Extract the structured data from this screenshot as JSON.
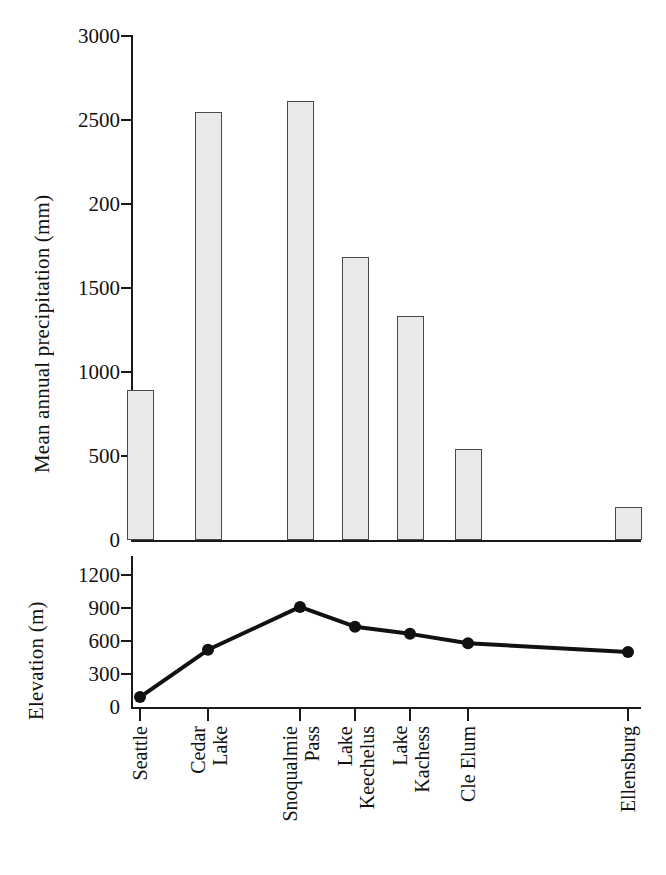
{
  "chart_data": [
    {
      "type": "bar",
      "panel": "top",
      "title": "",
      "xlabel": "",
      "ylabel": "Mean annual precipitation (mm)",
      "categories": [
        "Seattle",
        "Cedar Lake",
        "Snoqualmie Pass",
        "Lake Keechelus",
        "Lake Kachess",
        "Cle Elum",
        "Ellensburg"
      ],
      "values": [
        890,
        2540,
        2610,
        1680,
        1330,
        540,
        195
      ],
      "ylim": [
        0,
        3000
      ],
      "yticks": [
        0,
        500,
        1000,
        1500,
        2000,
        2500,
        3000
      ],
      "ytick_labels": [
        "0",
        "500",
        "1000",
        "1500",
        "200",
        "2500",
        "3000"
      ],
      "grid": false,
      "legend": "none",
      "bar_fill": "#e9e9e9",
      "bar_stroke": "#4a4a4a"
    },
    {
      "type": "line",
      "panel": "bottom",
      "title": "",
      "xlabel": "",
      "ylabel": "Elevation (m)",
      "categories": [
        "Seattle",
        "Cedar Lake",
        "Snoqualmie Pass",
        "Lake Keechelus",
        "Lake Kachess",
        "Cle Elum",
        "Ellensburg"
      ],
      "values": [
        90,
        520,
        910,
        730,
        665,
        580,
        500
      ],
      "ylim": [
        0,
        1200
      ],
      "yticks": [
        0,
        300,
        600,
        900,
        1200
      ],
      "ytick_labels": [
        "0",
        "300",
        "600",
        "900",
        "1200"
      ],
      "grid": false,
      "legend": "none",
      "line_color": "#111111",
      "marker": "circle"
    }
  ],
  "top_panel": {
    "axis_label": "Mean annual precipitation (mm)",
    "ticks": [
      {
        "label": "3000",
        "value": 3000
      },
      {
        "label": "2500",
        "value": 2500
      },
      {
        "label": "200",
        "value": 2000
      },
      {
        "label": "1500",
        "value": 1500
      },
      {
        "label": "1000",
        "value": 1000
      },
      {
        "label": "500",
        "value": 500
      },
      {
        "label": "0",
        "value": 0
      }
    ]
  },
  "bottom_panel": {
    "axis_label": "Elevation (m)",
    "ticks": [
      {
        "label": "1200",
        "value": 1200
      },
      {
        "label": "900",
        "value": 900
      },
      {
        "label": "600",
        "value": 600
      },
      {
        "label": "300",
        "value": 300
      },
      {
        "label": "0",
        "value": 0
      }
    ]
  },
  "x_axis": {
    "categories": [
      {
        "label": "Seattle"
      },
      {
        "label": "Cedar\nLake"
      },
      {
        "label": "Snoqualmie\nPass"
      },
      {
        "label": "Lake\nKeechelus"
      },
      {
        "label": "Lake\nKachess"
      },
      {
        "label": "Cle Elum"
      },
      {
        "label": "Ellensburg"
      }
    ]
  }
}
